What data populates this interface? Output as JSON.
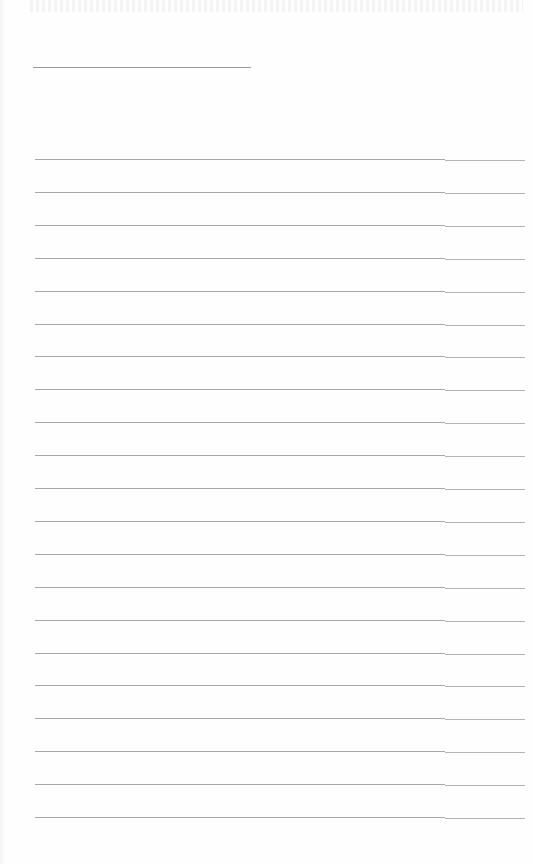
{
  "document": {
    "type": "lined writing sheet",
    "title_line": {
      "text": "",
      "top": 67,
      "left": 33,
      "width": 218
    },
    "rules": {
      "count": 21,
      "first_top": 159,
      "spacing": 32.9,
      "left": 35,
      "main_width": 410,
      "tail_width": 80
    },
    "colors": {
      "paper": "#fefefe",
      "rule": "#a8a8a8",
      "rule_tail": "#b4b4b4"
    }
  }
}
